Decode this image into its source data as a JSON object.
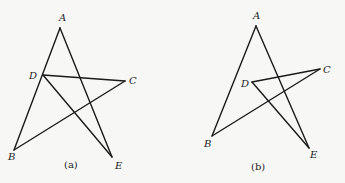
{
  "figures": [
    {
      "id": "a",
      "caption": "(a)",
      "caption_pos": [
        64,
        168
      ],
      "vertices": {
        "A": {
          "label": "A",
          "x": 60,
          "y": 28,
          "lx": 59,
          "ly": 21
        },
        "B": {
          "label": "B",
          "x": 14,
          "y": 150,
          "lx": 8,
          "ly": 160
        },
        "C": {
          "label": "C",
          "x": 125,
          "y": 81,
          "lx": 129,
          "ly": 84
        },
        "D": {
          "label": "D",
          "x": 43,
          "y": 75,
          "lx": 29,
          "ly": 79
        },
        "E": {
          "label": "E",
          "x": 112,
          "y": 157,
          "lx": 115,
          "ly": 169
        }
      },
      "edges": [
        [
          "A",
          "B"
        ],
        [
          "A",
          "E"
        ],
        [
          "D",
          "C"
        ],
        [
          "C",
          "B"
        ],
        [
          "D",
          "E"
        ]
      ]
    },
    {
      "id": "b",
      "caption": "(b)",
      "caption_pos": [
        251,
        170
      ],
      "vertices": {
        "A": {
          "label": "A",
          "x": 256,
          "y": 26,
          "lx": 253,
          "ly": 19
        },
        "B": {
          "label": "B",
          "x": 212,
          "y": 136,
          "lx": 204,
          "ly": 147
        },
        "C": {
          "label": "C",
          "x": 320,
          "y": 69,
          "lx": 323,
          "ly": 73
        },
        "D": {
          "label": "D",
          "x": 252,
          "y": 82,
          "lx": 241,
          "ly": 87
        },
        "E": {
          "label": "E",
          "x": 309,
          "y": 148,
          "lx": 310,
          "ly": 158
        }
      },
      "edges": [
        [
          "A",
          "B"
        ],
        [
          "A",
          "E"
        ],
        [
          "D",
          "C"
        ],
        [
          "C",
          "B"
        ],
        [
          "D",
          "E"
        ]
      ]
    }
  ]
}
